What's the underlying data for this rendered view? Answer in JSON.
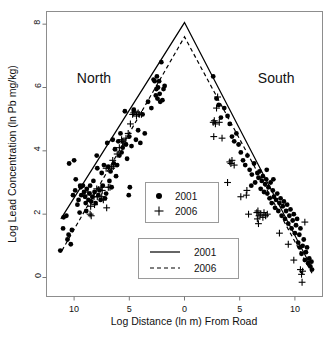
{
  "chart_data": {
    "type": "scatter",
    "title": "",
    "xlabel": "Log Distance (ln m) From Road",
    "ylabel": "Log Lead Concentration (ln Pb mg/kg)",
    "xlim": [
      -12.5,
      12.5
    ],
    "ylim": [
      -0.6,
      8.4
    ],
    "xticks": [
      -10,
      -5,
      0,
      5,
      10
    ],
    "xtick_labels": [
      "10",
      "5",
      "0",
      "5",
      "10"
    ],
    "yticks": [
      0,
      2,
      4,
      6,
      8
    ],
    "ytick_labels": [
      "0",
      "2",
      "4",
      "6",
      "8"
    ],
    "grid": false,
    "annotations": [
      {
        "text": "North",
        "x": -8.2,
        "y": 6.15
      },
      {
        "text": "South",
        "x": 8.3,
        "y": 6.15
      }
    ],
    "legend_points": {
      "position": "center",
      "entries": [
        {
          "label": "2001",
          "marker": "filled-circle"
        },
        {
          "label": "2006",
          "marker": "plus"
        }
      ]
    },
    "legend_lines": {
      "position": "center-lower",
      "entries": [
        {
          "label": "2001",
          "style": "solid"
        },
        {
          "label": "2006",
          "style": "dashed"
        }
      ]
    },
    "fit_lines": [
      {
        "name": "2001",
        "style": "solid",
        "points": [
          [
            -11.2,
            1.85
          ],
          [
            0,
            8.05
          ],
          [
            11.6,
            0.25
          ]
        ]
      },
      {
        "name": "2006",
        "style": "dashed",
        "points": [
          [
            -11.1,
            0.85
          ],
          [
            0,
            7.6
          ],
          [
            11.6,
            0.1
          ]
        ]
      }
    ],
    "series": [
      {
        "name": "2001",
        "marker": "filled-circle",
        "points": [
          [
            -11.25,
            0.85
          ],
          [
            -11.0,
            1.55
          ],
          [
            -10.95,
            1.9
          ],
          [
            -10.7,
            1.95
          ],
          [
            -10.6,
            1.2
          ],
          [
            -10.5,
            1.35
          ],
          [
            -10.45,
            3.6
          ],
          [
            -10.3,
            1.05
          ],
          [
            -10.2,
            1.5
          ],
          [
            -10.1,
            2.6
          ],
          [
            -10.0,
            3.7
          ],
          [
            -9.9,
            2.75
          ],
          [
            -9.85,
            3.1
          ],
          [
            -9.7,
            2.3
          ],
          [
            -9.6,
            2.45
          ],
          [
            -9.5,
            2.05
          ],
          [
            -9.4,
            2.85
          ],
          [
            -9.35,
            2.6
          ],
          [
            -9.2,
            2.9
          ],
          [
            -9.1,
            2.7
          ],
          [
            -9.0,
            2.55
          ],
          [
            -8.95,
            2.35
          ],
          [
            -8.85,
            2.8
          ],
          [
            -8.7,
            2.45
          ],
          [
            -8.6,
            2.65
          ],
          [
            -8.55,
            2.9
          ],
          [
            -8.45,
            2.4
          ],
          [
            -8.35,
            2.55
          ],
          [
            -8.25,
            3.05
          ],
          [
            -8.15,
            2.7
          ],
          [
            -8.05,
            2.35
          ],
          [
            -7.95,
            3.85
          ],
          [
            -7.9,
            3.45
          ],
          [
            -7.8,
            2.6
          ],
          [
            -7.7,
            2.75
          ],
          [
            -7.6,
            2.45
          ],
          [
            -7.5,
            3.3
          ],
          [
            -7.4,
            2.9
          ],
          [
            -7.3,
            3.55
          ],
          [
            -7.2,
            2.5
          ],
          [
            -7.1,
            2.65
          ],
          [
            -7.0,
            4.25
          ],
          [
            -6.9,
            3.5
          ],
          [
            -6.8,
            3.05
          ],
          [
            -6.7,
            3.35
          ],
          [
            -6.6,
            2.85
          ],
          [
            -6.5,
            4.35
          ],
          [
            -6.4,
            3.6
          ],
          [
            -6.3,
            4.05
          ],
          [
            -6.2,
            3.2
          ],
          [
            -6.1,
            3.55
          ],
          [
            -6.0,
            4.3
          ],
          [
            -5.9,
            3.85
          ],
          [
            -5.8,
            4.55
          ],
          [
            -5.7,
            3.95
          ],
          [
            -5.6,
            4.1
          ],
          [
            -5.4,
            5.25
          ],
          [
            -5.3,
            4.2
          ],
          [
            -5.2,
            3.75
          ],
          [
            -5.0,
            4.45
          ],
          [
            -4.8,
            4.15
          ],
          [
            -4.6,
            5.3
          ],
          [
            -4.4,
            4.35
          ],
          [
            -4.2,
            4.65
          ],
          [
            -4.0,
            4.25
          ],
          [
            -3.8,
            5.15
          ],
          [
            -3.6,
            4.55
          ],
          [
            -3.3,
            5.55
          ],
          [
            -3.0,
            5.35
          ],
          [
            -2.8,
            6.25
          ],
          [
            -2.7,
            6.2
          ],
          [
            -2.6,
            5.75
          ],
          [
            -2.55,
            5.95
          ],
          [
            -2.5,
            6.35
          ],
          [
            -2.45,
            5.65
          ],
          [
            -2.4,
            6.0
          ],
          [
            -2.3,
            6.2
          ],
          [
            -2.25,
            5.8
          ],
          [
            -2.2,
            5.55
          ],
          [
            -2.1,
            6.8
          ],
          [
            -2.0,
            5.6
          ],
          [
            -1.9,
            5.95
          ],
          [
            -1.8,
            6.05
          ],
          [
            2.6,
            6.35
          ],
          [
            2.9,
            5.65
          ],
          [
            3.1,
            5.45
          ],
          [
            3.3,
            5.05
          ],
          [
            3.6,
            5.35
          ],
          [
            3.9,
            5.1
          ],
          [
            4.1,
            4.85
          ],
          [
            4.3,
            4.45
          ],
          [
            4.5,
            4.3
          ],
          [
            4.7,
            4.55
          ],
          [
            4.9,
            4.2
          ],
          [
            5.1,
            3.95
          ],
          [
            5.3,
            3.7
          ],
          [
            5.5,
            3.55
          ],
          [
            5.7,
            3.85
          ],
          [
            5.9,
            3.4
          ],
          [
            6.1,
            3.25
          ],
          [
            6.3,
            3.6
          ],
          [
            6.4,
            3.0
          ],
          [
            6.6,
            3.3
          ],
          [
            6.7,
            3.15
          ],
          [
            6.8,
            3.35
          ],
          [
            6.9,
            2.8
          ],
          [
            7.0,
            3.05
          ],
          [
            7.1,
            3.2
          ],
          [
            7.2,
            2.7
          ],
          [
            7.3,
            2.95
          ],
          [
            7.4,
            3.1
          ],
          [
            7.5,
            2.65
          ],
          [
            7.6,
            2.85
          ],
          [
            7.7,
            2.5
          ],
          [
            7.8,
            3.0
          ],
          [
            7.9,
            2.35
          ],
          [
            8.0,
            2.75
          ],
          [
            8.1,
            2.55
          ],
          [
            8.2,
            2.2
          ],
          [
            8.3,
            2.45
          ],
          [
            8.4,
            2.65
          ],
          [
            8.5,
            2.1
          ],
          [
            8.6,
            2.35
          ],
          [
            8.7,
            2.5
          ],
          [
            8.8,
            1.95
          ],
          [
            8.9,
            2.25
          ],
          [
            9.0,
            2.4
          ],
          [
            9.1,
            1.85
          ],
          [
            9.2,
            2.1
          ],
          [
            9.3,
            2.3
          ],
          [
            9.4,
            1.7
          ],
          [
            9.5,
            1.95
          ],
          [
            9.6,
            2.15
          ],
          [
            9.7,
            1.55
          ],
          [
            9.8,
            1.8
          ],
          [
            9.9,
            2.0
          ],
          [
            10.0,
            1.4
          ],
          [
            10.1,
            1.65
          ],
          [
            10.2,
            1.85
          ],
          [
            10.3,
            1.1
          ],
          [
            10.4,
            1.35
          ],
          [
            10.5,
            1.55
          ],
          [
            10.6,
            0.75
          ],
          [
            10.7,
            1.0
          ],
          [
            10.8,
            1.2
          ],
          [
            10.9,
            0.55
          ],
          [
            11.0,
            0.8
          ],
          [
            11.1,
            0.95
          ],
          [
            11.2,
            0.45
          ],
          [
            11.3,
            0.6
          ],
          [
            11.4,
            0.35
          ],
          [
            11.5,
            0.5
          ],
          [
            11.55,
            0.25
          ],
          [
            -4.95,
            2.85
          ],
          [
            -5.05,
            2.6
          ],
          [
            -8.9,
            2.1
          ],
          [
            -9.45,
            2.9
          ],
          [
            7.45,
            3.4
          ],
          [
            8.05,
            3.1
          ],
          [
            6.05,
            2.9
          ],
          [
            10.45,
            0.95
          ]
        ]
      },
      {
        "name": "2006",
        "marker": "plus",
        "points": [
          [
            -8.55,
            2.0
          ],
          [
            -8.5,
            2.25
          ],
          [
            -8.45,
            1.95
          ],
          [
            -8.2,
            2.55
          ],
          [
            -8.15,
            2.3
          ],
          [
            -7.95,
            2.8
          ],
          [
            -7.9,
            2.55
          ],
          [
            -7.55,
            2.85
          ],
          [
            -7.5,
            2.55
          ],
          [
            -7.45,
            2.75
          ],
          [
            -7.35,
            2.45
          ],
          [
            -7.1,
            3.45
          ],
          [
            -7.05,
            2.2
          ],
          [
            -6.75,
            2.85
          ],
          [
            -6.6,
            3.45
          ],
          [
            -6.5,
            3.7
          ],
          [
            -6.45,
            3.5
          ],
          [
            -6.1,
            3.9
          ],
          [
            -5.9,
            4.1
          ],
          [
            -5.7,
            4.35
          ],
          [
            -5.6,
            4.3
          ],
          [
            -5.5,
            4.25
          ],
          [
            -5.3,
            4.4
          ],
          [
            -5.1,
            4.55
          ],
          [
            -4.9,
            4.85
          ],
          [
            -4.7,
            5.15
          ],
          [
            -4.6,
            5.2
          ],
          [
            -4.5,
            5.25
          ],
          [
            -4.35,
            5.1
          ],
          [
            -4.2,
            5.2
          ],
          [
            -4.1,
            5.15
          ],
          [
            -3.9,
            5.15
          ],
          [
            -9.1,
            2.6
          ],
          [
            -8.75,
            2.7
          ],
          [
            -6.9,
            2.85
          ],
          [
            2.6,
            4.9
          ],
          [
            2.65,
            4.45
          ],
          [
            2.7,
            4.95
          ],
          [
            2.8,
            4.85
          ],
          [
            2.9,
            5.35
          ],
          [
            3.0,
            5.7
          ],
          [
            3.15,
            4.9
          ],
          [
            3.4,
            4.4
          ],
          [
            3.9,
            3.0
          ],
          [
            4.1,
            3.65
          ],
          [
            4.2,
            3.6
          ],
          [
            4.3,
            3.7
          ],
          [
            4.5,
            3.55
          ],
          [
            5.6,
            2.6
          ],
          [
            5.65,
            2.75
          ],
          [
            5.8,
            2.0
          ],
          [
            6.55,
            2.05
          ],
          [
            6.6,
            1.85
          ],
          [
            6.65,
            2.1
          ],
          [
            6.7,
            1.7
          ],
          [
            6.75,
            1.95
          ],
          [
            6.9,
            2.0
          ],
          [
            7.1,
            1.9
          ],
          [
            7.2,
            2.05
          ],
          [
            7.35,
            1.95
          ],
          [
            7.5,
            2.0
          ],
          [
            8.6,
            1.4
          ],
          [
            9.4,
            1.05
          ],
          [
            10.5,
            0.25
          ],
          [
            10.6,
            0.1
          ],
          [
            10.65,
            -0.15
          ],
          [
            10.7,
            0.2
          ],
          [
            10.9,
            1.75
          ],
          [
            5.1,
            2.55
          ],
          [
            9.9,
            0.55
          ]
        ]
      }
    ]
  }
}
